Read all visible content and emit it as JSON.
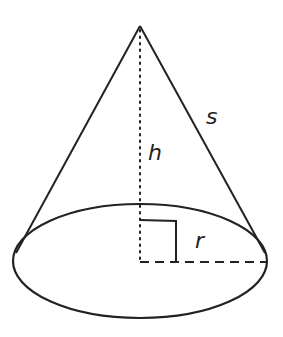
{
  "diagram": {
    "type": "cone",
    "labels": {
      "slant": "s",
      "height": "h",
      "radius": "r"
    },
    "colors": {
      "line": "#222222",
      "background": "#ffffff"
    }
  }
}
